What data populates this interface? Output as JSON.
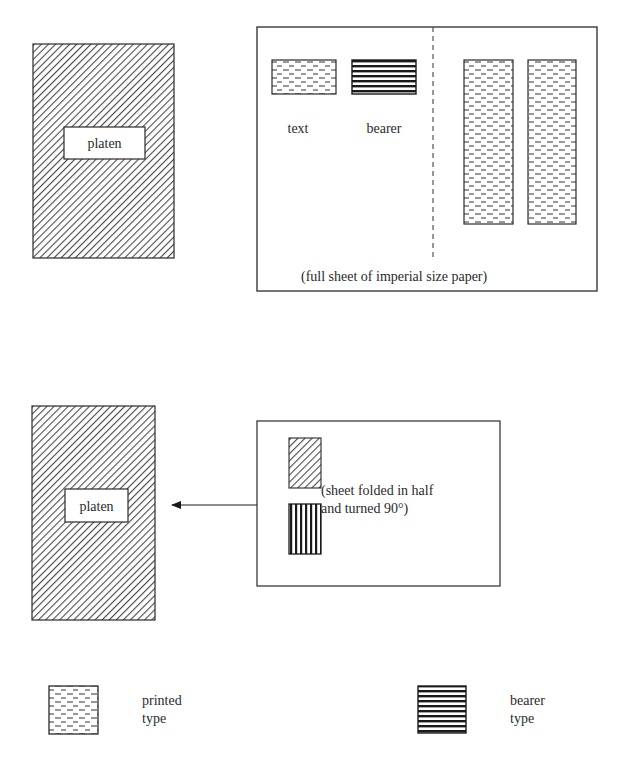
{
  "colors": {
    "background": "#ffffff",
    "stroke": "#2a2a2a",
    "hatch": "#4a4a4a",
    "text": "#2a2a2a"
  },
  "top_panel": {
    "platen": {
      "label": "platen",
      "fill_pattern": "diagonal-hatch"
    },
    "sheet": {
      "caption": "(full sheet of imperial size paper)",
      "fold_line": "dashed-vertical",
      "swatches": [
        {
          "label": "text",
          "pattern": "printed-type"
        },
        {
          "label": "bearer",
          "pattern": "bearer-type"
        }
      ],
      "columns": [
        {
          "pattern": "printed-type"
        },
        {
          "pattern": "printed-type"
        }
      ]
    }
  },
  "bottom_panel": {
    "platen": {
      "label": "platen",
      "fill_pattern": "diagonal-hatch"
    },
    "arrow": {
      "direction": "left"
    },
    "sheet": {
      "caption_line1": "(sheet folded in half",
      "caption_line2": "and turned 90°)",
      "blocks": [
        {
          "pattern": "diagonal-hatch"
        },
        {
          "pattern": "vertical-stripes"
        }
      ]
    }
  },
  "legend": {
    "items": [
      {
        "line1": "printed",
        "line2": "type",
        "pattern": "printed-type"
      },
      {
        "line1": "bearer",
        "line2": "type",
        "pattern": "bearer-type"
      }
    ]
  }
}
